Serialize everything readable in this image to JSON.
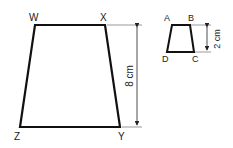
{
  "large_shape": {
    "vertices": {
      "top_left": "W",
      "top_right": "X",
      "bottom_right": "Y",
      "bottom_left": "Z"
    },
    "height_label": "8 cm"
  },
  "small_shape": {
    "vertices": {
      "top_left": "A",
      "top_right": "B",
      "bottom_right": "C",
      "bottom_left": "D"
    },
    "height_label": "2 cm"
  }
}
